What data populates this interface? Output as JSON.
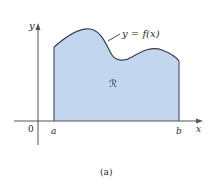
{
  "figure": {
    "caption": "(a)",
    "curve_label": "y = f(x)",
    "region_label": "ℛ",
    "axes": {
      "x_label": "x",
      "y_label": "y",
      "origin_label": "0",
      "left_bound_label": "a",
      "right_bound_label": "b"
    },
    "colors": {
      "fill": "#c3d6f0",
      "curve": "#3a3a4a",
      "axis": "#555555",
      "text": "#2a2a2a"
    }
  }
}
